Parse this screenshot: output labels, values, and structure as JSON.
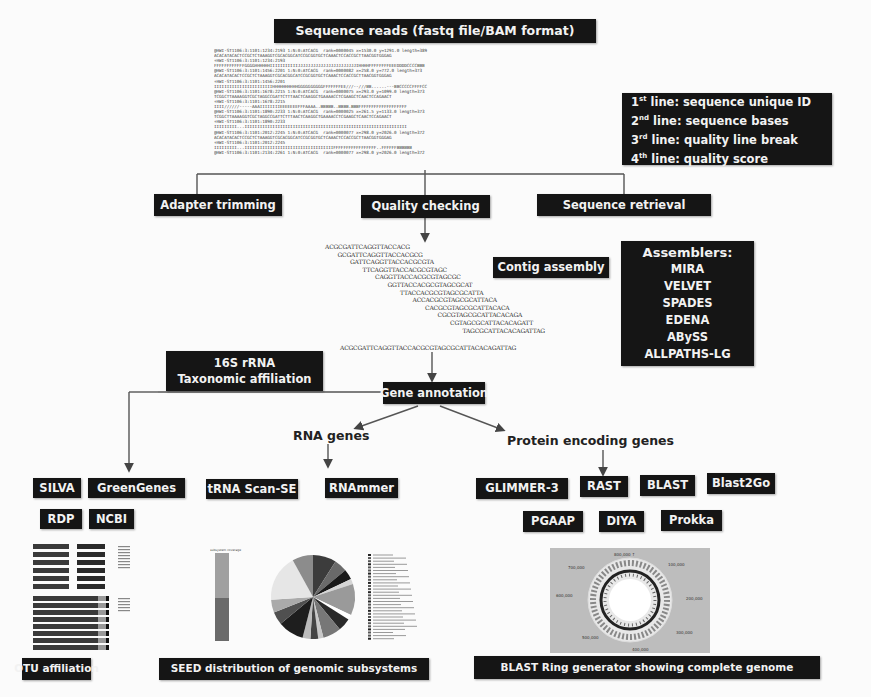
{
  "title": "Sequence reads (fastq file/BAM format)",
  "fastq_lines": [
    "@HWI-ST1106:3:1101:1234:2193 1:N:0:ATCACG  rank=0000045 x=1530.0 y=1291.0 length=389",
    "ACACATACACTCCGCTCTAAAGGTCGCACGGCATCCGCGGTGCTCAAACTCCACCGCTTAACGGTGGGAG",
    "+HWI-ST1106:3:1101:1234:2193",
    "FFFFFFFFFFFFGGGGHHHHHHIIIIIIIIIIIJJJJJJJJJJJJJJJJJJJJJJJIHHHHFFFFFFFFEEEDDDDCCCCBBB",
    "@HWI-ST1106:3:1101:1456:2201 1:N:0:ATCACG  rank=0000082 x=258.0 y=772.0 length=373",
    "ACACATACACTCCGCTCTAAAGGTCGCACGGCATCCGCGGTGCTCAAACTCCACCGCTTAACGGTGGGAG",
    "+HWI-ST1106:3:1101:1456:2201",
    "IIIIIIIIIIIIIIIIIIIIIIIHHHHHHHHHHGGGGGGGGGGFFFFFFFEE///--///BB......---BBCCCCCFFFFCC",
    "@HWI-ST1106:3:1101:1678:2215 1:N:0:ATCACG  rank=0000075 x=293.0 y=1099.0 length=373",
    "TCGGCTTAAAAGGTCGCTAGGCCGATTCTTTAACTCAAGGCTGAAAACCTCGAAGCTCAACTCCAGAACT",
    "+HWI-ST1106:3:1101:1678:2215",
    "IIII//////-----AAAIIIIIIIIEEEEEEEFFFAAAA..BBBBB..BBBB.BBBFFFFFFFFFFFFFFFFFFF",
    "@HWI-ST1106:3:1101:1890:2233 1:N:0:ATCACG  rank=0000025 x=261.5 y=1133.0 length=373",
    "TCGGCTTAAAAGGTCGCTAGGCCGATTCTTTAACTCAAGGCTGAAAACCTCGAAGCTCAACTCCAGAACT",
    "+HWI-ST1106:3:1101:1890:2233",
    "IIIIIIIII...IIIIIIIIIIIIIIIIIIIIIIIIIIIIIIIIIIIIIIIIIIIIIIIIIIIIIIIIIIIIIIII",
    "@HWI-ST1106:3:1101:2012:2245 1:N:0:ATCACG  rank=0000077 x=298.0 y=2026.0 length=372",
    "ACACATACACTCCGCTCTAAAGGTCGCACGGCATCCGCGGTGCTCAAACTCCACCGCTTAACGGTGGGAG",
    "+HWI-ST1106:3:1101:2012:2245",
    "IIIIIIIII...IIIIIIIIIIIIIIIIIIIIIIIIIIIIIIIIIIIFFFFFFFFFFFFFFFFF..FFFFFFBBBBBB",
    "@HWI-ST1106:3:1101:2134:2261 1:N:0:ATCACG  rank=0000077 x=298.0 y=2026.0 length=372"
  ],
  "fastq_legend": {
    "lines": [
      {
        "ord": "1",
        "sup": "st",
        "text": " line: sequence unique ID"
      },
      {
        "ord": "2",
        "sup": "nd",
        "text": " line: sequence bases"
      },
      {
        "ord": "3",
        "sup": "rd",
        "text": " line: quality line break"
      },
      {
        "ord": "4",
        "sup": "th",
        "text": " line: quality score"
      }
    ]
  },
  "preprocessing": {
    "adapter_trimming": "Adapter trimming",
    "quality_checking": "Quality checking",
    "sequence_retrieval": "Sequence retrieval"
  },
  "contig": {
    "label": "Contig assembly",
    "reads": [
      "ACGCGATTCAGGTTACCACG",
      "GCGATTCAGGTTACCACGCG",
      "GATTCAGGTTACCACGCGTA",
      "TTCAGGTTACCACGCGTAGC",
      "CAGGTTACCACGCGTAGCGC",
      "GGTTACCACGCGTAGCGCAT",
      "TTACCACGCGTAGCGCATTA",
      "ACCACGCGTAGCGCATTACA",
      "CACGCGTAGCGCATTACACA",
      "CGCGTAGCGCATTACACAGA",
      "CGTAGCGCATTACACAGATT",
      "TAGCGCATTACACAGATTAG"
    ],
    "consensus": "ACGCGATTCAGGTTACCACGCGTAGCGCATTACACAGATTAG"
  },
  "assemblers": {
    "title": "Assemblers:",
    "items": [
      "MIRA",
      "VELVET",
      "SPADES",
      "EDENA",
      "ABySS",
      "ALLPATHS-LG"
    ]
  },
  "taxonomy": {
    "line1": "16S rRNA",
    "line2": "Taxonomic affiliation",
    "tools": [
      "SILVA",
      "GreenGenes",
      "RDP",
      "NCBI"
    ]
  },
  "gene_annotation": "Gene annotation",
  "rna_genes": {
    "label": "RNA genes",
    "tools": [
      "tRNA Scan-SE",
      "RNAmmer"
    ]
  },
  "protein_genes": {
    "label": "Protein encoding genes",
    "tools_row1": [
      "GLIMMER-3",
      "RAST",
      "BLAST",
      "Blast2Go"
    ],
    "tools_row2": [
      "PGAAP",
      "DIYA",
      "Prokka"
    ]
  },
  "outputs": {
    "otu": "OTU affiliation",
    "seed": "SEED distribution of genomic subsystems",
    "blast_ring": "BLAST Ring generator showing complete genome"
  },
  "colors": {
    "box_bg": "#151515",
    "box_text": "#f2f2f2",
    "background": "#fbfbfb",
    "ring_panel": "#bdbdbd"
  }
}
